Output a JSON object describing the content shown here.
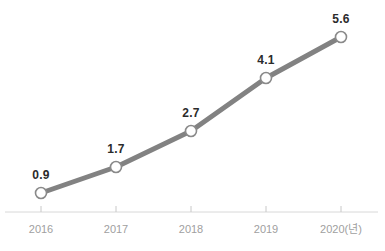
{
  "chart_data": {
    "type": "line",
    "title": "",
    "subtitle": "",
    "xlabel": "",
    "ylabel": "",
    "categories": [
      "2016",
      "2017",
      "2018",
      "2019",
      "2020"
    ],
    "tick_labels": [
      "2016",
      "2017",
      "2018",
      "2019",
      "2020(년)"
    ],
    "values": [
      0.9,
      1.7,
      2.7,
      4.1,
      5.6
    ],
    "data_labels": [
      "0.9",
      "1.7",
      "2.7",
      "4.1",
      "5.6"
    ],
    "series": [
      {
        "name": "",
        "values": [
          0.9,
          1.7,
          2.7,
          4.1,
          5.6
        ]
      }
    ],
    "xlim": [
      2016,
      2020
    ],
    "ylim": [
      0,
      6.2
    ],
    "grid": false,
    "legend": false,
    "legend_position": "none",
    "axis_unit_note": "년",
    "colors": {
      "line": "#828282",
      "marker_fill": "#ffffff",
      "marker_stroke": "#8a8a8a",
      "axis": "#d8d8d8",
      "tick_mark": "#c8c8c8",
      "data_label_text": "#2b2b2b",
      "tick_label_text": "#a0a0a0",
      "background": "#ffffff"
    },
    "geometry": {
      "points": [
        {
          "x": 41,
          "y": 193
        },
        {
          "x": 116,
          "y": 167
        },
        {
          "x": 191,
          "y": 131
        },
        {
          "x": 266,
          "y": 78
        },
        {
          "x": 341,
          "y": 37
        }
      ],
      "label_offsets_y": [
        -14,
        -14,
        -14,
        -14,
        -14
      ],
      "axis_y": 212,
      "axis_x_start": 5,
      "axis_x_end": 378,
      "tick_top": 206,
      "tick_bottom": 212,
      "tick_label_y": 224,
      "marker_radius": 5.5,
      "line_width": 5
    }
  }
}
